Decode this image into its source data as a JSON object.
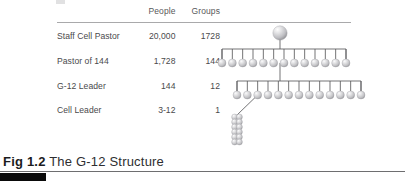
{
  "figure": {
    "caption_number": "Fig 1.2",
    "caption_text": " The G-12 Structure"
  },
  "table": {
    "columns": [
      "",
      "People",
      "Groups"
    ],
    "rows": [
      {
        "label": "Staff Cell Pastor",
        "people": "20,000",
        "groups": "1728"
      },
      {
        "label": "Pastor of 144",
        "people": "1,728",
        "groups": "144"
      },
      {
        "label": "G-12 Leader",
        "people": "144",
        "groups": "12"
      },
      {
        "label": "Cell Leader",
        "people": "3-12",
        "groups": "1"
      }
    ]
  },
  "diagram": {
    "type": "organizational-tree",
    "root_node_count": 1,
    "tier1_node_count": 13,
    "tier2_node_count": 13,
    "cell_cluster_count": 12,
    "sphere_color": "#c9c9cb",
    "sphere_highlight": "#f2f2f3",
    "line_color": "#5a5a5c"
  },
  "decor": {
    "rule_color": "#a9a9ab",
    "bottom_rule_color": "#6e6e70",
    "tab_color": "#0a0a0a"
  }
}
